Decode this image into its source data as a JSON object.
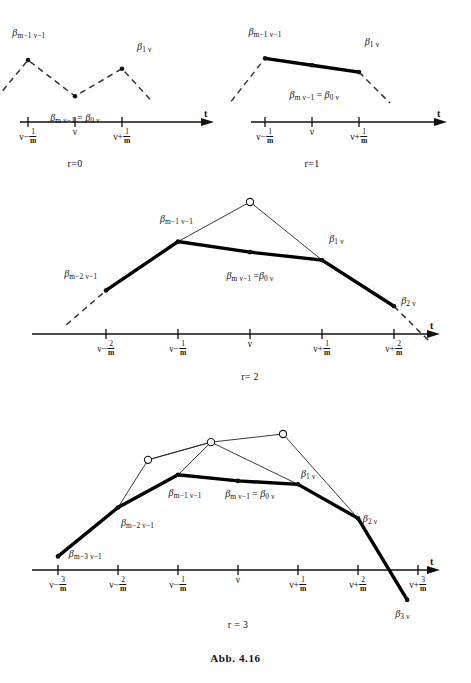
{
  "figure": {
    "caption": "Abb. 4.16",
    "colors": {
      "ink": "#111111",
      "thick_stroke": "#000000",
      "thin_stroke": "#222222",
      "dashed_stroke": "#333333"
    }
  },
  "chart_data": {
    "type": "line",
    "title": "Abb. 4.16",
    "xlabel": "t",
    "ylabel": "",
    "grid": false,
    "legend": "none",
    "panels": [
      {
        "name": "panel-r0",
        "r_label": "r=0",
        "axis_label": "t",
        "ticks": [
          {
            "id": "t-minus-1",
            "base": "ν−",
            "num": "1",
            "den": "m",
            "x": 0.0
          },
          {
            "id": "t-zero",
            "base": "ν",
            "num": "",
            "den": "",
            "x": 1.0
          },
          {
            "id": "t-plus-1",
            "base": "ν+",
            "num": "1",
            "den": "m",
            "x": 2.0
          }
        ],
        "points": [
          {
            "id": "p-m1-v1",
            "x": 0.0,
            "y": 0.72,
            "marker": "dot"
          },
          {
            "id": "p-m-v1",
            "x": 1.0,
            "y": 0.3,
            "marker": "dot"
          },
          {
            "id": "p-1-v",
            "x": 2.0,
            "y": 0.62,
            "marker": "dot"
          }
        ],
        "thick_polyline": [],
        "thin_polyline": [],
        "dashed_polyline": [
          {
            "x": -0.68,
            "y": 0.27
          },
          {
            "x": 0.0,
            "y": 0.72
          },
          {
            "x": 1.0,
            "y": 0.3
          },
          {
            "x": 2.0,
            "y": 0.62
          },
          {
            "x": 2.62,
            "y": 0.25
          }
        ],
        "labels": [
          {
            "id": "lbl-bm1v1",
            "beta": "β",
            "sub": "m−1 ν−1",
            "x": 0.02,
            "y": 1.02,
            "anchor": "middle"
          },
          {
            "id": "lbl-bmv1-b0v",
            "beta": "β",
            "sub": "m ν−1",
            "eq": "= β",
            "sub2": "0 ν",
            "x": 1.0,
            "y": 0.03,
            "anchor": "middle"
          },
          {
            "id": "lbl-b1v",
            "beta": "β",
            "sub": "1 ν",
            "x": 2.32,
            "y": 0.86,
            "anchor": "start"
          }
        ]
      },
      {
        "name": "panel-r1",
        "r_label": "r=1",
        "axis_label": "t",
        "ticks": [
          {
            "id": "t-minus-1",
            "base": "ν−",
            "num": "1",
            "den": "m",
            "x": 0.0
          },
          {
            "id": "t-zero",
            "base": "ν",
            "num": "",
            "den": "",
            "x": 1.0
          },
          {
            "id": "t-plus-1",
            "base": "ν+",
            "num": "1",
            "den": "m",
            "x": 2.0
          }
        ],
        "points": [
          {
            "id": "p-m1-v1",
            "x": 0.0,
            "y": 0.74,
            "marker": "dot"
          },
          {
            "id": "p-mid",
            "x": 1.0,
            "y": 0.66,
            "marker": "dot"
          },
          {
            "id": "p-1-v",
            "x": 2.0,
            "y": 0.58,
            "marker": "dot"
          }
        ],
        "thick_polyline": [
          {
            "x": 0.0,
            "y": 0.74
          },
          {
            "x": 1.0,
            "y": 0.66
          },
          {
            "x": 2.0,
            "y": 0.58
          }
        ],
        "thin_polyline": [],
        "dashed_polyline": [
          {
            "x": -0.72,
            "y": 0.24
          },
          {
            "x": 0.0,
            "y": 0.74
          }
        ],
        "dashed_polyline2": [
          {
            "x": 2.0,
            "y": 0.58
          },
          {
            "x": 2.66,
            "y": 0.22
          }
        ],
        "labels": [
          {
            "id": "lbl-bm1v1",
            "beta": "β",
            "sub": "m−1 ν−1",
            "x": 0.0,
            "y": 1.04,
            "anchor": "middle"
          },
          {
            "id": "lbl-bmv1-b0v",
            "beta": "β",
            "sub": "m ν−1",
            "eq": "= β",
            "sub2": "0 ν",
            "x": 1.05,
            "y": 0.3,
            "anchor": "middle"
          },
          {
            "id": "lbl-b1v",
            "beta": "β",
            "sub": "1 ν",
            "x": 2.12,
            "y": 0.92,
            "anchor": "start"
          }
        ]
      },
      {
        "name": "panel-r2",
        "r_label": "r= 2",
        "axis_label": "t",
        "ticks": [
          {
            "id": "t-minus-2",
            "base": "ν−",
            "num": "2",
            "den": "m",
            "x": -1.0
          },
          {
            "id": "t-minus-1",
            "base": "ν−",
            "num": "1",
            "den": "m",
            "x": 0.0
          },
          {
            "id": "t-zero",
            "base": "ν",
            "num": "",
            "den": "",
            "x": 1.0
          },
          {
            "id": "t-plus-1",
            "base": "ν+",
            "num": "1",
            "den": "m",
            "x": 2.0
          },
          {
            "id": "t-plus-2",
            "base": "ν+",
            "num": "2",
            "den": "m",
            "x": 3.0
          }
        ],
        "points": [
          {
            "id": "p-m2-v1",
            "x": -1.0,
            "y": 0.33,
            "marker": "dot"
          },
          {
            "id": "p-m1-v1",
            "x": 0.0,
            "y": 0.7,
            "marker": "dot"
          },
          {
            "id": "p-apex",
            "x": 1.0,
            "y": 1.0,
            "marker": "circle"
          },
          {
            "id": "p-mid",
            "x": 1.0,
            "y": 0.62,
            "marker": "dot"
          },
          {
            "id": "p-1-v",
            "x": 2.0,
            "y": 0.56,
            "marker": "dot"
          },
          {
            "id": "p-2-v",
            "x": 3.0,
            "y": 0.21,
            "marker": "dot"
          }
        ],
        "thick_polyline": [
          {
            "x": -1.0,
            "y": 0.33
          },
          {
            "x": 0.0,
            "y": 0.7
          },
          {
            "x": 1.0,
            "y": 0.62
          },
          {
            "x": 2.0,
            "y": 0.56
          },
          {
            "x": 3.0,
            "y": 0.21
          }
        ],
        "thin_polyline": [
          {
            "x": 0.0,
            "y": 0.7
          },
          {
            "x": 1.0,
            "y": 1.0
          },
          {
            "x": 2.0,
            "y": 0.56
          }
        ],
        "dashed_polyline": [
          {
            "x": -1.55,
            "y": 0.07
          },
          {
            "x": -1.0,
            "y": 0.33
          }
        ],
        "dashed_polyline2": [
          {
            "x": 3.0,
            "y": 0.21
          },
          {
            "x": 3.5,
            "y": -0.06
          }
        ],
        "labels": [
          {
            "id": "lbl-bm2v1",
            "beta": "β",
            "sub": "m−2 ν−1",
            "x": -1.12,
            "y": 0.45,
            "anchor": "end"
          },
          {
            "id": "lbl-bm1v1",
            "beta": "β",
            "sub": "m−1 ν−1",
            "x": -0.02,
            "y": 0.86,
            "anchor": "middle"
          },
          {
            "id": "lbl-bmv1-b0v",
            "beta": "β",
            "sub": "m ν−1",
            "eq": "=β",
            "sub2": "0 ν",
            "x": 1.0,
            "y": 0.43,
            "anchor": "middle"
          },
          {
            "id": "lbl-b1v",
            "beta": "β",
            "sub": "1 ν",
            "x": 2.1,
            "y": 0.71,
            "anchor": "start"
          },
          {
            "id": "lbl-b2v",
            "beta": "β",
            "sub": "2 ν",
            "x": 3.1,
            "y": 0.24,
            "anchor": "start"
          }
        ]
      },
      {
        "name": "panel-r3",
        "r_label": "r = 3",
        "axis_label": "t",
        "ticks": [
          {
            "id": "t-minus-3",
            "base": "ν−",
            "num": "3",
            "den": "m",
            "x": -2.0
          },
          {
            "id": "t-minus-2",
            "base": "ν−",
            "num": "2",
            "den": "m",
            "x": -1.0
          },
          {
            "id": "t-minus-1",
            "base": "ν−",
            "num": "1",
            "den": "m",
            "x": 0.0
          },
          {
            "id": "t-zero",
            "base": "ν",
            "num": "",
            "den": "",
            "x": 1.0
          },
          {
            "id": "t-plus-1",
            "base": "ν+",
            "num": "1",
            "den": "m",
            "x": 2.0
          },
          {
            "id": "t-plus-2",
            "base": "ν+",
            "num": "2",
            "den": "m",
            "x": 3.0
          },
          {
            "id": "t-plus-3",
            "base": "ν+",
            "num": "3",
            "den": "m",
            "x": 4.0
          }
        ],
        "points": [
          {
            "id": "p-m3-v1",
            "x": -2.0,
            "y": 0.1,
            "marker": "dot"
          },
          {
            "id": "p-m2-v1",
            "x": -1.0,
            "y": 0.46,
            "marker": "dot"
          },
          {
            "id": "p-m1-v1",
            "x": 0.0,
            "y": 0.7,
            "marker": "dot"
          },
          {
            "id": "p-circ-left",
            "x": -0.5,
            "y": 0.81,
            "marker": "circle"
          },
          {
            "id": "p-circ-mid",
            "x": 0.55,
            "y": 0.94,
            "marker": "circle"
          },
          {
            "id": "p-circ-right",
            "x": 1.75,
            "y": 1.0,
            "marker": "circle"
          },
          {
            "id": "p-mid",
            "x": 1.0,
            "y": 0.655,
            "marker": "dot"
          },
          {
            "id": "p-1-v",
            "x": 2.0,
            "y": 0.63,
            "marker": "dot"
          },
          {
            "id": "p-2-v",
            "x": 3.0,
            "y": 0.38,
            "marker": "dot"
          },
          {
            "id": "p-3-v",
            "x": 3.82,
            "y": -0.22,
            "marker": "dot"
          }
        ],
        "thick_polyline": [
          {
            "x": -2.0,
            "y": 0.1
          },
          {
            "x": -1.0,
            "y": 0.46
          },
          {
            "x": 0.0,
            "y": 0.7
          },
          {
            "x": 1.0,
            "y": 0.655
          },
          {
            "x": 2.0,
            "y": 0.63
          },
          {
            "x": 3.0,
            "y": 0.38
          },
          {
            "x": 3.82,
            "y": -0.22
          }
        ],
        "thin_polyline_a": [
          {
            "x": -1.0,
            "y": 0.46
          },
          {
            "x": -0.5,
            "y": 0.81
          },
          {
            "x": 0.55,
            "y": 0.94
          },
          {
            "x": 1.75,
            "y": 1.0
          },
          {
            "x": 3.0,
            "y": 0.38
          }
        ],
        "thin_polyline_b": [
          {
            "x": -0.5,
            "y": 0.81
          },
          {
            "x": 0.55,
            "y": 0.94
          },
          {
            "x": 2.0,
            "y": 0.63
          }
        ],
        "thin_polyline_c": [
          {
            "x": 0.0,
            "y": 0.7
          },
          {
            "x": 0.55,
            "y": 0.94
          }
        ],
        "labels": [
          {
            "id": "lbl-bm3v1",
            "beta": "β",
            "sub": "m−3 ν−1",
            "x": -1.82,
            "y": 0.11,
            "anchor": "start"
          },
          {
            "id": "lbl-bm2v1",
            "beta": "β",
            "sub": "m−2 ν−1",
            "x": -0.95,
            "y": 0.34,
            "anchor": "start"
          },
          {
            "id": "lbl-bm1v1",
            "beta": "β",
            "sub": "m−1 ν−1",
            "x": 0.12,
            "y": 0.56,
            "anchor": "middle"
          },
          {
            "id": "lbl-bmv1-b0v",
            "beta": "β",
            "sub": "m ν−1",
            "eq": "= β",
            "sub2": "0 ν",
            "x": 1.2,
            "y": 0.555,
            "anchor": "middle"
          },
          {
            "id": "lbl-b1v",
            "beta": "β",
            "sub": "1 ν",
            "x": 2.05,
            "y": 0.7,
            "anchor": "start"
          },
          {
            "id": "lbl-b2v",
            "beta": "β",
            "sub": "2 ν",
            "x": 3.08,
            "y": 0.37,
            "anchor": "start"
          },
          {
            "id": "lbl-b3v",
            "beta": "β",
            "sub": "3 ν",
            "x": 3.62,
            "y": -0.33,
            "anchor": "start"
          }
        ]
      }
    ]
  }
}
